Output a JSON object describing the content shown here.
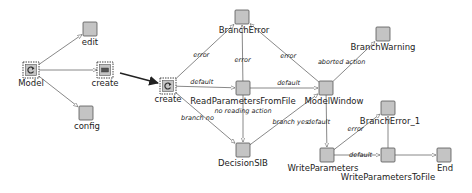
{
  "diagram": {
    "colors": {
      "node_fill": "#c4c4c4",
      "node_stroke": "#555555",
      "edge_stroke": "#6a6a6a",
      "big_arrow": "#222222",
      "label": "#222222"
    },
    "nodes": [
      {
        "id": "model",
        "label": "Model",
        "kind": "sub-model",
        "icon": "cycle-icon"
      },
      {
        "id": "edit",
        "label": "edit",
        "kind": "plain"
      },
      {
        "id": "create_left",
        "label": "create",
        "kind": "sub-model",
        "icon": "window-icon"
      },
      {
        "id": "config",
        "label": "config",
        "kind": "plain"
      },
      {
        "id": "create_main",
        "label": "create",
        "kind": "start",
        "icon": "cycle-icon"
      },
      {
        "id": "branch_error",
        "label": "BranchError",
        "kind": "plain"
      },
      {
        "id": "read_params",
        "label": "ReadParametersFromFile",
        "kind": "plain"
      },
      {
        "id": "model_window",
        "label": "ModelWindow",
        "kind": "plain"
      },
      {
        "id": "decision_sib",
        "label": "DecisionSIB",
        "kind": "plain"
      },
      {
        "id": "branch_warning",
        "label": "BranchWarning",
        "kind": "plain"
      },
      {
        "id": "branch_error_1",
        "label": "BranchError_1",
        "kind": "plain"
      },
      {
        "id": "write_params",
        "label": "WriteParameters",
        "kind": "plain"
      },
      {
        "id": "write_params_file",
        "label": "WriteParametersToFile",
        "kind": "plain"
      },
      {
        "id": "end",
        "label": "End",
        "kind": "plain"
      }
    ],
    "edges": [
      {
        "from": "model",
        "to": "edit",
        "label": ""
      },
      {
        "from": "model",
        "to": "create_left",
        "label": ""
      },
      {
        "from": "model",
        "to": "config",
        "label": ""
      },
      {
        "from": "create_left",
        "to": "create_main",
        "label": "",
        "style": "zoom-arrow"
      },
      {
        "from": "create_main",
        "to": "branch_error",
        "label": "error"
      },
      {
        "from": "read_params",
        "to": "branch_error",
        "label": "error"
      },
      {
        "from": "model_window",
        "to": "branch_error",
        "label": "error"
      },
      {
        "from": "create_main",
        "to": "read_params",
        "label": "default"
      },
      {
        "from": "read_params",
        "to": "model_window",
        "label": "default"
      },
      {
        "from": "read_params",
        "to": "decision_sib",
        "label": "no reading action"
      },
      {
        "from": "create_main",
        "to": "decision_sib",
        "label": "branch no"
      },
      {
        "from": "decision_sib",
        "to": "model_window",
        "label": "branch yes"
      },
      {
        "from": "model_window",
        "to": "branch_warning",
        "label": "aborted action"
      },
      {
        "from": "model_window",
        "to": "write_params",
        "label": "default"
      },
      {
        "from": "write_params",
        "to": "branch_error_1",
        "label": "error"
      },
      {
        "from": "write_params",
        "to": "write_params_file",
        "label": "default"
      },
      {
        "from": "write_params_file",
        "to": "branch_error_1",
        "label": ""
      },
      {
        "from": "write_params_file",
        "to": "end",
        "label": ""
      }
    ]
  }
}
